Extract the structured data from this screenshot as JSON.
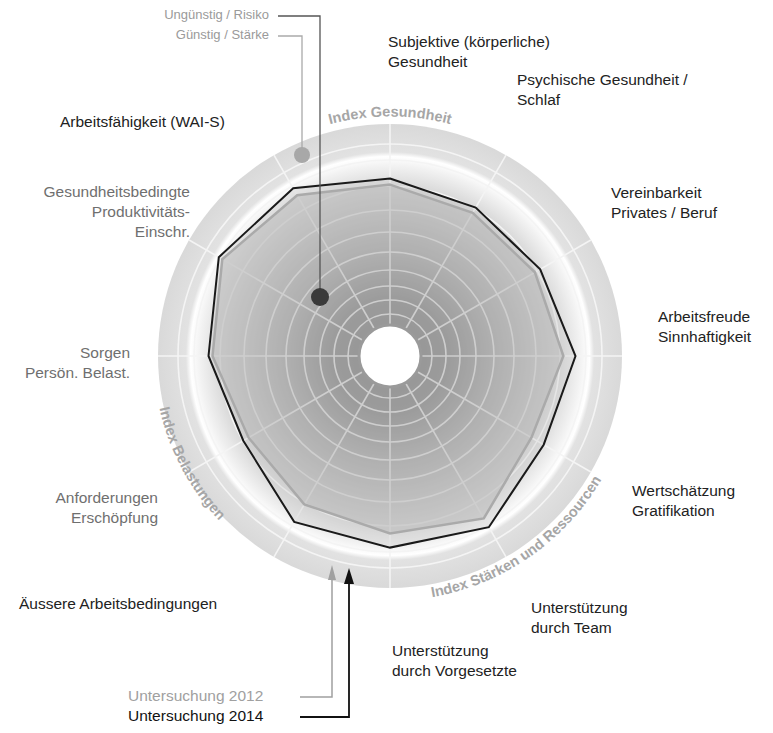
{
  "legend_top": {
    "risk": "Ungünstig / Risiko",
    "strength": "Günstig / Stärke"
  },
  "legend_bottom": {
    "y2012": "Untersuchung 2012",
    "y2014": "Untersuchung 2014"
  },
  "index_labels": {
    "health": "Index Gesundheit",
    "burden": "Index Belastungen",
    "resources": "Index Stärken und Ressourcen"
  },
  "dimension_labels": [
    {
      "lines": [
        "Subjektive (körperliche)",
        "Gesundheit"
      ]
    },
    {
      "lines": [
        "Psychische Gesundheit /",
        "Schlaf"
      ]
    },
    {
      "lines": [
        "Vereinbarkeit",
        "Privates / Beruf"
      ]
    },
    {
      "lines": [
        "Arbeitsfreude",
        "Sinnhaftigkeit"
      ]
    },
    {
      "lines": [
        "Wertschätzung",
        "Gratifikation"
      ]
    },
    {
      "lines": [
        "Unterstützung",
        "durch Team"
      ]
    },
    {
      "lines": [
        "Unterstützung",
        "durch Vorgesetzte"
      ]
    },
    {
      "lines": [
        "Äussere Arbeitsbedingungen"
      ]
    },
    {
      "lines": [
        "Anforderungen",
        "Erschöpfung"
      ]
    },
    {
      "lines": [
        "Sorgen",
        "Persön. Belast."
      ]
    },
    {
      "lines": [
        "Gesundheitsbedingte",
        "Produktivitäts-",
        "Einschr."
      ]
    },
    {
      "lines": [
        "Arbeitsfähigkeit (WAI-S)"
      ]
    }
  ],
  "colors": {
    "series_2014": "#1a1a1a",
    "series_2012": "#9a9a9a",
    "risk_dot": "#3a3a3a",
    "strength_dot": "#a8a8a8",
    "ring_band": "#d8d8d8",
    "index_label": "#a6a6a6"
  },
  "chart_data": {
    "type": "radar",
    "title": "",
    "scale_note": "0 = inner circle (Ungünstig / Risiko), 100 = outer rim (Günstig / Stärke)",
    "range": [
      0,
      100
    ],
    "grid": true,
    "axes_clockwise_from_top": [
      "Spoke 1 (top)",
      "Spoke 2",
      "Spoke 3",
      "Spoke 4 (right)",
      "Spoke 5",
      "Spoke 6",
      "Spoke 7 (bottom)",
      "Spoke 8",
      "Spoke 9",
      "Spoke 10 (left)",
      "Spoke 11",
      "Spoke 12"
    ],
    "categories": [
      "Subjektive (körperliche) Gesundheit",
      "Psychische Gesundheit / Schlaf",
      "Vereinbarkeit Privates / Beruf",
      "Arbeitsfreude Sinnhaftigkeit",
      "Wertschätzung Gratifikation",
      "Unterstützung durch Team",
      "Unterstützung durch Vorgesetzte",
      "Äussere Arbeitsbedingungen",
      "Anforderungen Erschöpfung",
      "Sorgen Persön. Belast.",
      "Gesundheitsbedingte Produktivitäts-Einschr.",
      "Arbeitsfähigkeit (WAI-S)"
    ],
    "series": [
      {
        "name": "Untersuchung 2012",
        "values": [
          70,
          67,
          68,
          71,
          66,
          78,
          73,
          70,
          66,
          73,
          81,
          77
        ]
      },
      {
        "name": "Untersuchung 2014",
        "values": [
          73,
          70,
          71,
          77,
          73,
          83,
          80,
          80,
          69,
          75,
          83,
          81
        ]
      }
    ],
    "groups": [
      {
        "name": "Index Gesundheit"
      },
      {
        "name": "Index Stärken und Ressourcen"
      },
      {
        "name": "Index Belastungen"
      }
    ],
    "legend": [
      "Ungünstig / Risiko",
      "Günstig / Stärke",
      "Untersuchung 2012",
      "Untersuchung 2014"
    ]
  }
}
